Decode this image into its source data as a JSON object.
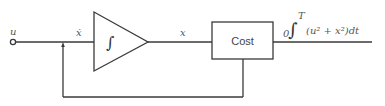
{
  "diagram": {
    "input_label": "u",
    "derivative_label": "ẋ",
    "integrator_symbol": "∫",
    "state_label": "x",
    "cost_block_label": "Cost",
    "output_expression": {
      "lower_limit": "0",
      "integral": "∫",
      "upper_limit": "T",
      "integrand": "(u² + x²)dt"
    },
    "colors": {
      "line": "#3a3a3a",
      "text": "#555555"
    }
  }
}
